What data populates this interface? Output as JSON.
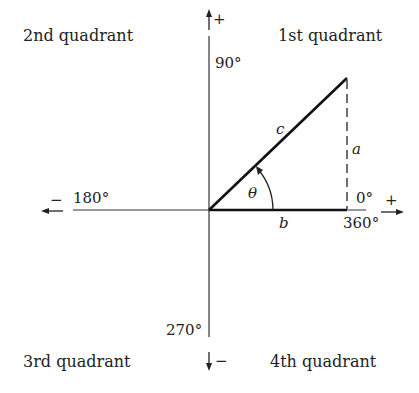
{
  "diagram": {
    "quadrants": {
      "q1": "1st quadrant",
      "q2": "2nd quadrant",
      "q3": "3rd quadrant",
      "q4": "4th quadrant"
    },
    "angles": {
      "a0": "0°",
      "a90": "90°",
      "a180": "180°",
      "a270": "270°",
      "a360": "360°"
    },
    "signs": {
      "up": "+",
      "down": "−",
      "left": "−",
      "right": "+"
    },
    "sides": {
      "opposite": "a",
      "adjacent": "b",
      "hypotenuse": "c",
      "angle": "θ"
    },
    "colors": {
      "ink": "#222222",
      "background": "#ffffff"
    }
  }
}
